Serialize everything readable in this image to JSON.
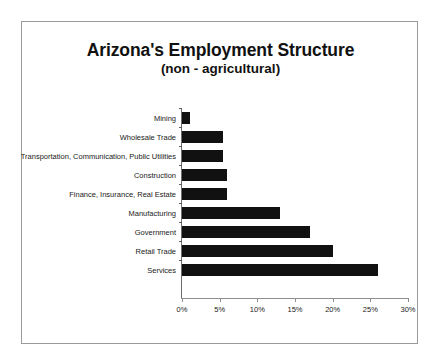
{
  "chart_data": {
    "type": "bar",
    "orientation": "horizontal",
    "title": "Arizona's Employment Structure",
    "subtitle": "(non - agricultural)",
    "xlabel": "",
    "ylabel": "",
    "xlim": [
      0,
      30
    ],
    "xticks": [
      0,
      5,
      10,
      15,
      20,
      25,
      30
    ],
    "xtick_labels": [
      "0%",
      "5%",
      "10%",
      "15%",
      "20%",
      "25%",
      "30%"
    ],
    "grid": false,
    "legend": null,
    "bar_color": "#111111",
    "categories": [
      "Mining",
      "Wholesale Trade",
      "Transportation, Communication, Public Utilities",
      "Construction",
      "Finance, Insurance, Real Estate",
      "Manufacturing",
      "Government",
      "Retail Trade",
      "Services"
    ],
    "values": [
      1,
      5.4,
      5.4,
      6,
      6,
      13,
      17,
      20,
      26
    ],
    "value_unit": "percent"
  },
  "figure": {
    "background_color": "#ffffff",
    "frame_color": "#9a9a9a",
    "axis_color": "#8d8d8d"
  }
}
